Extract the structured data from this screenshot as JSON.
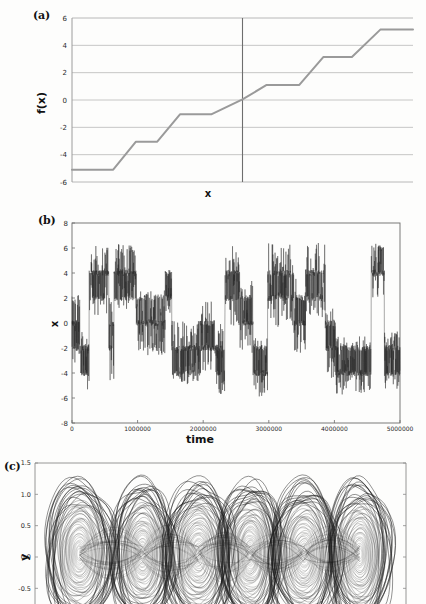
{
  "figure": {
    "background": "#fdfdfc",
    "ink": "#1a1a1a"
  },
  "panels": [
    {
      "id": "a",
      "label": "(a)",
      "ylabel": "f(x)",
      "xlabel": "x"
    },
    {
      "id": "b",
      "label": "(b)",
      "ylabel": "x",
      "xlabel": "time"
    },
    {
      "id": "c",
      "label": "(c)",
      "ylabel": "y",
      "xlabel": ""
    }
  ],
  "chart_data": [
    {
      "type": "line",
      "panel": "(a)",
      "title": "",
      "xlabel": "x",
      "ylabel": "f(x)",
      "ylim": [
        -6,
        6
      ],
      "xlim": [
        -6,
        6
      ],
      "yticks": [
        6,
        4,
        2,
        0,
        -2,
        -4,
        -6
      ],
      "ytick_labels": [
        "6",
        "4",
        "2",
        "0",
        "-2",
        "-4",
        "-6"
      ],
      "xticks": [],
      "xtick_labels": [],
      "grid": "horizontal",
      "grid_color": "#b8b8b8",
      "line_color": "#9a9a9a",
      "line_width": 2.0,
      "description": "Piecewise-linear staircase (multi-step) nonlinearity with plateaus at odd values and linear ramps between them; a vertical axis line marks x = 0 where f crosses 0.",
      "vertical_axis_line": {
        "x": 0,
        "color": "#6e6e6e"
      },
      "plateaus": [
        -5,
        -3,
        -1,
        1,
        3,
        5
      ],
      "x": [
        -6.0,
        -4.55,
        -3.75,
        -3.0,
        -2.2,
        -1.45,
        -0.7,
        0.0,
        0.75,
        1.5,
        2.25,
        3.0,
        3.8,
        4.55,
        5.3,
        6.0
      ],
      "y": [
        -5.1,
        -5.1,
        -3.05,
        -3.05,
        -1.05,
        -1.05,
        -1.05,
        0.05,
        1.1,
        1.1,
        3.15,
        3.15,
        3.15,
        5.15,
        5.15,
        5.15
      ],
      "step_points": [
        {
          "x": -6.0,
          "y": -5.1
        },
        {
          "x": -4.55,
          "y": -5.1
        },
        {
          "x": -3.75,
          "y": -3.05
        },
        {
          "x": -3.0,
          "y": -3.05
        },
        {
          "x": -2.2,
          "y": -1.05
        },
        {
          "x": -1.1,
          "y": -1.05
        },
        {
          "x": 0.0,
          "y": 0.05
        },
        {
          "x": 0.85,
          "y": 1.1
        },
        {
          "x": 2.0,
          "y": 1.1
        },
        {
          "x": 2.85,
          "y": 3.15
        },
        {
          "x": 3.85,
          "y": 3.15
        },
        {
          "x": 4.85,
          "y": 5.15
        },
        {
          "x": 6.0,
          "y": 5.15
        }
      ]
    },
    {
      "type": "line",
      "panel": "(b)",
      "title": "",
      "xlabel": "time",
      "ylabel": "x",
      "ylim": [
        -8,
        8
      ],
      "xlim": [
        0,
        5000000
      ],
      "yticks": [
        8,
        6,
        4,
        2,
        0,
        -2,
        -4,
        -6,
        -8
      ],
      "ytick_labels": [
        "8",
        "6",
        "4",
        "2",
        "0",
        "-2",
        "-4",
        "-6",
        "-8"
      ],
      "xticks": [
        0,
        1000000,
        2000000,
        3000000,
        4000000,
        5000000
      ],
      "xtick_labels": [
        "0",
        "1000000",
        "2000000",
        "3000000",
        "4000000",
        "5000000"
      ],
      "grid": "none",
      "line_color": "#262626",
      "line_width": 0.4,
      "description": "Chaotic time series x(t) showing intermittent hopping between quantized plateau bands centred near -6, -4, -2, 0, 2, 4, 6; dense high-frequency oscillation within each band.",
      "band_centers": [
        -6,
        -4,
        -2,
        0,
        2,
        4,
        6
      ],
      "envelope_segments": [
        {
          "t_start": 0,
          "t_end": 120000,
          "center": 0,
          "spread": 3.2
        },
        {
          "t_start": 120000,
          "t_end": 260000,
          "center": -3.0,
          "spread": 2.6
        },
        {
          "t_start": 260000,
          "t_end": 560000,
          "center": 3.4,
          "spread": 2.8
        },
        {
          "t_start": 560000,
          "t_end": 640000,
          "center": -1.0,
          "spread": 3.6
        },
        {
          "t_start": 640000,
          "t_end": 980000,
          "center": 3.6,
          "spread": 2.7
        },
        {
          "t_start": 980000,
          "t_end": 1150000,
          "center": 0.2,
          "spread": 2.4
        },
        {
          "t_start": 1150000,
          "t_end": 1420000,
          "center": 0.0,
          "spread": 2.6
        },
        {
          "t_start": 1420000,
          "t_end": 1520000,
          "center": 2.6,
          "spread": 2.0
        },
        {
          "t_start": 1520000,
          "t_end": 1960000,
          "center": -2.4,
          "spread": 2.6
        },
        {
          "t_start": 1960000,
          "t_end": 2180000,
          "center": -1.0,
          "spread": 3.0
        },
        {
          "t_start": 2180000,
          "t_end": 2330000,
          "center": -2.6,
          "spread": 3.2
        },
        {
          "t_start": 2330000,
          "t_end": 2560000,
          "center": 3.0,
          "spread": 3.2
        },
        {
          "t_start": 2560000,
          "t_end": 2760000,
          "center": 0.4,
          "spread": 3.0
        },
        {
          "t_start": 2760000,
          "t_end": 2980000,
          "center": -3.6,
          "spread": 2.4
        },
        {
          "t_start": 2980000,
          "t_end": 3380000,
          "center": 3.0,
          "spread": 3.4
        },
        {
          "t_start": 3380000,
          "t_end": 3560000,
          "center": 0.6,
          "spread": 3.0
        },
        {
          "t_start": 3560000,
          "t_end": 3860000,
          "center": 3.4,
          "spread": 3.0
        },
        {
          "t_start": 3860000,
          "t_end": 4020000,
          "center": -1.2,
          "spread": 3.2
        },
        {
          "t_start": 4020000,
          "t_end": 4560000,
          "center": -3.4,
          "spread": 2.4
        },
        {
          "t_start": 4560000,
          "t_end": 4760000,
          "center": 4.4,
          "spread": 2.4
        },
        {
          "t_start": 4760000,
          "t_end": 5000000,
          "center": -3.0,
          "spread": 2.4
        }
      ]
    },
    {
      "type": "line",
      "panel": "(c)",
      "title": "",
      "xlabel": "",
      "ylabel": "y",
      "ylim": [
        -0.75,
        1.5
      ],
      "yticks": [
        1.5,
        1.0,
        0.5,
        0.0,
        -0.5
      ],
      "ytick_labels": [
        "1.5",
        "1.0",
        "0.5",
        "0.0",
        "-0.5"
      ],
      "xticks": [],
      "xtick_labels": [],
      "grid": "none",
      "line_color": "#1c1c1c",
      "line_width": 0.3,
      "description": "Multi-scroll chaotic attractor in the (x, y) phase plane: six side-by-side scroll cells of densely wound concentric orbits, each with a small empty core; the figure is cropped at the bottom of the page.",
      "scroll_count": 6,
      "scroll_centers_y": 0.05,
      "scroll_centers_x": [
        0.12,
        0.29,
        0.44,
        0.58,
        0.725,
        0.875
      ],
      "cropped": true
    }
  ]
}
